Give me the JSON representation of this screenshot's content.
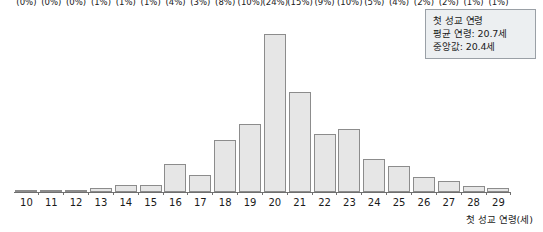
{
  "stat_box": {
    "title": "첫 성교 연령",
    "mean_line": "평균 연령: 20.7세",
    "median_line": "중앙값: 20.4세"
  },
  "axis": {
    "x_title": "첫 성교 연령(세)"
  },
  "colors": {
    "bar_fill": "#e6e6e6",
    "bar_border": "#8c8c8c",
    "axis": "#6f6f6f",
    "box_fill": "#eceff1",
    "box_border": "#9aa0a6",
    "text": "#1a1a1a"
  },
  "chart_data": {
    "type": "bar",
    "title": "첫 성교 연령",
    "xlabel": "첫 성교 연령(세)",
    "ylabel": "",
    "grid": false,
    "legend": "none",
    "ylim": [
      0,
      173
    ],
    "categories": [
      "10",
      "11",
      "12",
      "13",
      "14",
      "15",
      "16",
      "17",
      "18",
      "19",
      "20",
      "21",
      "22",
      "23",
      "24",
      "25",
      "26",
      "27",
      "28",
      "29"
    ],
    "values": [
      1,
      1,
      2,
      4,
      8,
      8,
      31,
      19,
      57,
      75,
      173,
      109,
      63,
      69,
      36,
      29,
      16,
      12,
      7,
      4
    ],
    "percent_labels": [
      "(0%)",
      "(0%)",
      "(0%)",
      "(1%)",
      "(1%)",
      "(1%)",
      "(4%)",
      "(3%)",
      "(8%)",
      "(10%)",
      "(24%)",
      "(15%)",
      "(9%)",
      "(10%)",
      "(5%)",
      "(4%)",
      "(2%)",
      "(2%)",
      "(1%)",
      "(1%)"
    ],
    "value_labels": [
      "1",
      "1",
      "2",
      "4",
      "8",
      "8",
      "31",
      "19",
      "57",
      "75",
      "173",
      "109",
      "63",
      "69",
      "36",
      "29",
      "16",
      "12",
      "7",
      "4"
    ],
    "annotations": [
      "평균 연령: 20.7세",
      "중앙값: 20.4세"
    ],
    "mean": 20.7,
    "median": 20.4
  }
}
